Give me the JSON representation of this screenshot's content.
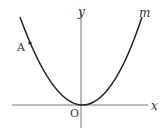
{
  "diagram": {
    "type": "parabola-graph",
    "curve_label": "m",
    "point_label": "A",
    "origin_label": "O",
    "x_axis_label": "x",
    "y_axis_label": "y",
    "colors": {
      "line": "#333333",
      "axis": "#666666",
      "background": "#ffffff"
    }
  }
}
